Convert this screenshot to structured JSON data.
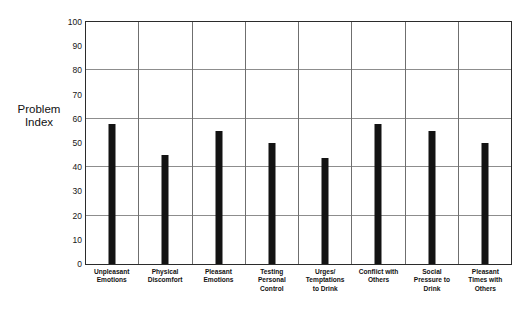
{
  "scan_artifact_text": "",
  "chart_data": {
    "type": "bar",
    "title": "",
    "xlabel": "",
    "ylabel": "Problem Index",
    "ylabel_lines": [
      "Problem",
      "Index"
    ],
    "ylim": [
      0,
      100
    ],
    "ytick_labels": [
      "100",
      "90",
      "80",
      "70",
      "60",
      "50",
      "40",
      "30",
      "20",
      "10",
      "0"
    ],
    "ytick_values": [
      100,
      90,
      80,
      70,
      60,
      50,
      40,
      30,
      20,
      10,
      0
    ],
    "gridline_values": [
      80,
      60,
      40,
      20
    ],
    "grid": true,
    "legend": false,
    "bar_color": "#131313",
    "categories": [
      "Unpleasant Emotions",
      "Physical Discomfort",
      "Pleasant Emotions",
      "Testing Personal Control",
      "Urges/ Temptations to Drink",
      "Conflict with Others",
      "Social Pressure to Drink",
      "Pleasant Times with Others"
    ],
    "category_lines": [
      [
        "Unpleasant",
        "Emotions"
      ],
      [
        "Physical",
        "Discomfort"
      ],
      [
        "Pleasant",
        "Emotions"
      ],
      [
        "Testing",
        "Personal",
        "Control"
      ],
      [
        "Urges/",
        "Temptations",
        "to Drink"
      ],
      [
        "Conflict with",
        "Others"
      ],
      [
        "Social",
        "Pressure to",
        "Drink"
      ],
      [
        "Pleasant",
        "Times with",
        "Others"
      ]
    ],
    "values": [
      58,
      45,
      55,
      50,
      44,
      58,
      55,
      50
    ]
  }
}
